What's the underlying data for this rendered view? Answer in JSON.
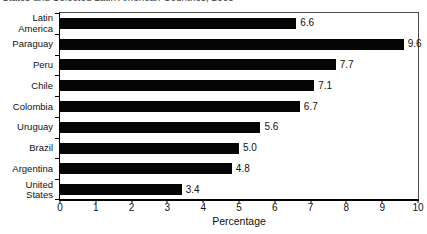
{
  "figure": {
    "cropped_title_text": "States and Selected Latin American Countries, 2005"
  },
  "chart_data": {
    "type": "bar",
    "orientation": "horizontal",
    "categories": [
      "Latin America",
      "Paraguay",
      "Peru",
      "Chile",
      "Colombia",
      "Uruguay",
      "Brazil",
      "Argentina",
      "United States"
    ],
    "category_display": [
      "Latin\nAmerica",
      "Paraguay",
      "Peru",
      "Chile",
      "Colombia",
      "Uruguay",
      "Brazil",
      "Argentina",
      "United\nStates"
    ],
    "values": [
      6.6,
      9.6,
      7.7,
      7.1,
      6.7,
      5.6,
      5.0,
      4.8,
      3.4
    ],
    "data_labels": [
      "6.6",
      "9.6",
      "7.7",
      "7.1",
      "6.7",
      "5.6",
      "5.0",
      "4.8",
      "3.4"
    ],
    "xlabel": "Percentage",
    "xlim": [
      0,
      10
    ],
    "x_ticks": [
      "0",
      "1",
      "2",
      "3",
      "4",
      "5",
      "6",
      "7",
      "8",
      "9",
      "10"
    ],
    "bar_color": "#050505",
    "grid": false,
    "legend": false
  }
}
